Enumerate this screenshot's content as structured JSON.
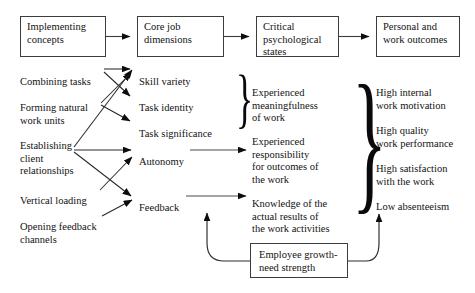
{
  "diagram": {
    "stroke_color": "#3c3c3c",
    "text_color": "#121212",
    "background": "#ffffff"
  },
  "header_boxes": [
    {
      "id": "implementing-concepts",
      "label": "Implementing\nconcepts"
    },
    {
      "id": "core-job-dimensions",
      "label": "Core job\ndimensions"
    },
    {
      "id": "critical-psychological-states",
      "label": "Critical\npsychological\nstates"
    },
    {
      "id": "personal-and-work-outcomes",
      "label": "Personal and\nwork outcomes"
    }
  ],
  "implementing_concepts": [
    {
      "id": "combining-tasks",
      "label": "Combining tasks"
    },
    {
      "id": "forming-natural-work-units",
      "label": "Forming natural\nwork units"
    },
    {
      "id": "establishing-client-relationships",
      "label": "Establishing\nclient\nrelationships"
    },
    {
      "id": "vertical-loading",
      "label": "Vertical loading"
    },
    {
      "id": "opening-feedback-channels",
      "label": "Opening feedback\nchannels"
    }
  ],
  "core_job_dimensions": [
    {
      "id": "skill-variety",
      "label": "Skill variety"
    },
    {
      "id": "task-identity",
      "label": "Task identity"
    },
    {
      "id": "task-significance",
      "label": "Task significance"
    },
    {
      "id": "autonomy",
      "label": "Autonomy"
    },
    {
      "id": "feedback",
      "label": "Feedback"
    }
  ],
  "critical_psychological_states": [
    {
      "id": "experienced-meaningfulness",
      "label": "Experienced\nmeaningfulness\nof work"
    },
    {
      "id": "experienced-responsibility",
      "label": "Experienced\nresponsibility\nfor outcomes of\nthe work"
    },
    {
      "id": "knowledge-of-results",
      "label": "Knowledge of the\nactual results of\nthe work activities"
    }
  ],
  "personal_and_work_outcomes": [
    {
      "id": "high-internal-work-motivation",
      "label": "High internal\nwork motivation"
    },
    {
      "id": "high-quality-work-performance",
      "label": "High quality\nwork performance"
    },
    {
      "id": "high-satisfaction-with-the-work",
      "label": "High satisfaction\nwith the work"
    },
    {
      "id": "low-absenteeism",
      "label": "Low absenteeism"
    }
  ],
  "moderator": {
    "id": "employee-growth-need-strength",
    "label": "Employee growth-\nneed strength"
  },
  "braces": {
    "core_dimensions_brace": "}",
    "outcomes_brace": "}"
  }
}
